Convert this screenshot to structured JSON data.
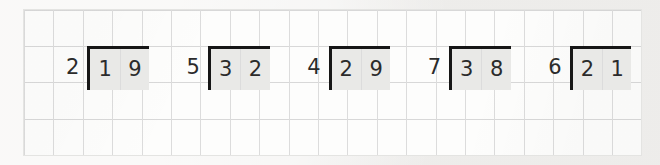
{
  "worksheet": {
    "kind": "long-division-practice",
    "paper": {
      "style": "grid-paper",
      "columns": 21,
      "rows": 4,
      "cell_size_px": 29,
      "line_color": "#dcdcdc",
      "sheet_color": "#fdfdfc",
      "background_color": "#f3f2f0"
    },
    "ink": {
      "digit_color": "#2b2b2b",
      "bracket_color": "#161616",
      "dividend_fill": "#e9e9e7"
    },
    "problems": [
      {
        "divisor": "2",
        "dividend_digits": [
          "1",
          "9"
        ],
        "dividend": "19"
      },
      {
        "divisor": "5",
        "dividend_digits": [
          "3",
          "2"
        ],
        "dividend": "32"
      },
      {
        "divisor": "4",
        "dividend_digits": [
          "2",
          "9"
        ],
        "dividend": "29"
      },
      {
        "divisor": "7",
        "dividend_digits": [
          "3",
          "8"
        ],
        "dividend": "38"
      },
      {
        "divisor": "6",
        "dividend_digits": [
          "2",
          "1"
        ],
        "dividend": "21"
      }
    ]
  }
}
